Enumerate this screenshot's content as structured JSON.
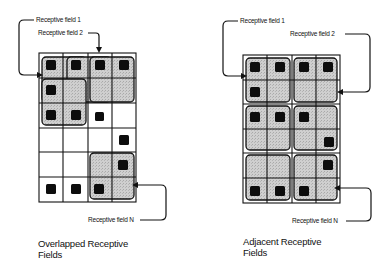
{
  "panels": [
    {
      "id": "overlapped",
      "caption_line1": "Overlapped Receptive",
      "caption_line2": "Fields",
      "labels": {
        "field1": "Receptive field 1",
        "field2": "Receptive field 2",
        "fieldN": "Receptive field N"
      },
      "grid": {
        "rows": 6,
        "cols": 4
      },
      "dots": [
        [
          0,
          0
        ],
        [
          0,
          1
        ],
        [
          0,
          2
        ],
        [
          0,
          3
        ],
        [
          1,
          0
        ],
        [
          2,
          0
        ],
        [
          2,
          1
        ],
        [
          2,
          2
        ],
        [
          3,
          3
        ],
        [
          4,
          3
        ],
        [
          5,
          0
        ],
        [
          5,
          1
        ],
        [
          5,
          2
        ]
      ]
    },
    {
      "id": "adjacent",
      "caption_line1": "Adjacent Receptive",
      "caption_line2": "Fields",
      "labels": {
        "field1": "Receptive field 1",
        "field2": "Receptive field 2",
        "fieldN": "Receptive field N"
      },
      "grid": {
        "rows": 6,
        "cols": 4
      },
      "dots": [
        [
          0,
          0
        ],
        [
          0,
          1
        ],
        [
          0,
          2
        ],
        [
          0,
          3
        ],
        [
          1,
          0
        ],
        [
          2,
          0
        ],
        [
          2,
          1
        ],
        [
          2,
          2
        ],
        [
          3,
          3
        ],
        [
          4,
          3
        ],
        [
          5,
          0
        ],
        [
          5,
          1
        ],
        [
          5,
          2
        ]
      ]
    }
  ],
  "colors": {
    "line": "#111111",
    "field_fill": "#c8c8c8",
    "dot": "#0d0d0d",
    "background": "#ffffff"
  }
}
